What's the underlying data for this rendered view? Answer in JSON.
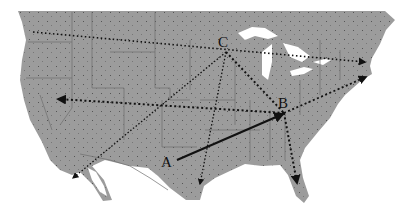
{
  "map": {
    "type": "US map with routes",
    "colors": {
      "land": "#9a9a9a",
      "water": "#ffffff",
      "borders": "#6e6e6e",
      "routes": "#111111"
    },
    "points": [
      {
        "id": "A",
        "label": "A",
        "x": 168,
        "y": 163
      },
      {
        "id": "B",
        "label": "B",
        "x": 284,
        "y": 104
      },
      {
        "id": "C",
        "label": "C",
        "x": 222,
        "y": 45
      }
    ],
    "routes": [
      {
        "from": "A",
        "to": "B",
        "style": "solid"
      },
      {
        "from": "C",
        "to": "B",
        "style": "dotted"
      },
      {
        "from": "C",
        "to": "southwest",
        "style": "dotted"
      },
      {
        "from": "C",
        "to": "south",
        "style": "dotted"
      },
      {
        "from": "B",
        "to": "west",
        "style": "dotted"
      },
      {
        "from": "B",
        "to": "northeast",
        "style": "dotted"
      },
      {
        "from": "B",
        "to": "florida",
        "style": "dotted"
      },
      {
        "from": "northwest",
        "to": "northeast",
        "style": "dotted"
      }
    ]
  }
}
